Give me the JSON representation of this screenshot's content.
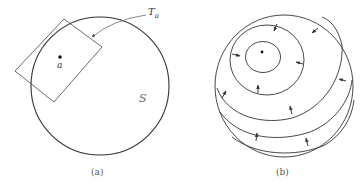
{
  "figure_a": {
    "caption": "(a)",
    "point_label": "a",
    "tangent_plane_label": "T",
    "tangent_plane_subscript": "a",
    "surface_label": "S"
  },
  "figure_b": {
    "caption": "(b)"
  },
  "colors": {
    "stroke": "#333333",
    "background": "#ffffff"
  }
}
